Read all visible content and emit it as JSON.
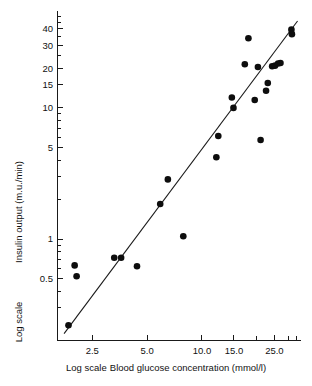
{
  "chart_data": {
    "type": "scatter",
    "title": "",
    "xlabel": "Blood glucose concentration (mmol/l)",
    "ylabel": "Insulin output (m.u./min)",
    "x_axis_note": "Log scale",
    "y_axis_note": "Log scale",
    "x_scale": "log",
    "y_scale": "log",
    "grid": false,
    "legend": "none",
    "xlim": [
      1.6,
      35.0
    ],
    "ylim": [
      0.17,
      52.0
    ],
    "xticks": [
      2.5,
      5.0,
      10.0,
      15.0,
      25.0
    ],
    "xtick_labels": [
      "2.5",
      "5.0",
      "10.0",
      "15.0",
      "25.0"
    ],
    "x_minor_ticks": [
      20.0,
      30.0,
      33.0
    ],
    "yticks": [
      0.5,
      1,
      5,
      10,
      15,
      20,
      30,
      40
    ],
    "ytick_labels": [
      "0.5",
      "1",
      "5",
      "10",
      "15",
      "20",
      "30",
      "40"
    ],
    "points": [
      {
        "x": 1.85,
        "y": 0.22
      },
      {
        "x": 2.05,
        "y": 0.52
      },
      {
        "x": 2.0,
        "y": 0.63
      },
      {
        "x": 3.3,
        "y": 0.72
      },
      {
        "x": 3.6,
        "y": 0.72
      },
      {
        "x": 4.4,
        "y": 0.62
      },
      {
        "x": 5.9,
        "y": 1.85
      },
      {
        "x": 6.5,
        "y": 2.85
      },
      {
        "x": 7.9,
        "y": 1.05
      },
      {
        "x": 12.3,
        "y": 6.1
      },
      {
        "x": 12.0,
        "y": 4.2
      },
      {
        "x": 14.6,
        "y": 12.0
      },
      {
        "x": 14.9,
        "y": 10.0
      },
      {
        "x": 17.2,
        "y": 21.5
      },
      {
        "x": 18.0,
        "y": 34.0
      },
      {
        "x": 19.5,
        "y": 11.5
      },
      {
        "x": 20.3,
        "y": 20.5
      },
      {
        "x": 21.0,
        "y": 5.7
      },
      {
        "x": 22.5,
        "y": 13.5
      },
      {
        "x": 23.0,
        "y": 15.5
      },
      {
        "x": 24.3,
        "y": 20.8
      },
      {
        "x": 25.2,
        "y": 21.0
      },
      {
        "x": 26.2,
        "y": 21.8
      },
      {
        "x": 27.0,
        "y": 22.0
      },
      {
        "x": 31.0,
        "y": 39.5
      },
      {
        "x": 31.2,
        "y": 36.5
      }
    ],
    "regression_line": {
      "x_start": 1.75,
      "y_start": 0.19,
      "x_end": 33.5,
      "y_end": 46.0
    },
    "colors": {
      "point": "#0d0d0d",
      "line": "#1a1a1a",
      "axis": "#1a1a1a",
      "background": "#ffffff"
    }
  }
}
